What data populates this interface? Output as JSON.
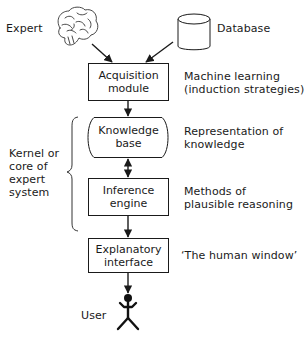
{
  "diagram": {
    "sources": {
      "expert": {
        "label": "Expert",
        "icon": "brain-icon"
      },
      "database": {
        "label": "Database",
        "icon": "database-cylinder-icon"
      }
    },
    "nodes": [
      {
        "id": "acquisition",
        "line1": "Acquisition",
        "line2": "module",
        "shape": "rectangle",
        "annotation": {
          "line1": "Machine learning",
          "line2": "(induction strategies)"
        }
      },
      {
        "id": "knowledge",
        "line1": "Knowledge",
        "line2": "base",
        "shape": "rounded-sides",
        "annotation": {
          "line1": "Representation of",
          "line2": "knowledge"
        }
      },
      {
        "id": "inference",
        "line1": "Inference",
        "line2": "engine",
        "shape": "rectangle",
        "annotation": {
          "line1": "Methods of",
          "line2": "plausible reasoning"
        }
      },
      {
        "id": "explanatory",
        "line1": "Explanatory",
        "line2": "interface",
        "shape": "rectangle",
        "annotation": {
          "line1": "‘The human window’"
        }
      }
    ],
    "group": {
      "brace_label": [
        "Kernel or",
        "core of",
        "expert",
        "system"
      ],
      "spans": [
        "knowledge",
        "inference"
      ]
    },
    "user": {
      "label": "User",
      "icon": "stick-figure-icon"
    },
    "edges": [
      {
        "from": "expert",
        "to": "acquisition",
        "type": "arrow"
      },
      {
        "from": "database",
        "to": "acquisition",
        "type": "arrow"
      },
      {
        "from": "acquisition",
        "to": "knowledge",
        "type": "arrow"
      },
      {
        "from": "knowledge",
        "to": "inference",
        "type": "double-arrow"
      },
      {
        "from": "inference",
        "to": "explanatory",
        "type": "arrow"
      },
      {
        "from": "explanatory",
        "to": "user",
        "type": "arrow"
      }
    ],
    "colors": {
      "ink": "#1a1a1a",
      "background": "#ffffff"
    }
  }
}
